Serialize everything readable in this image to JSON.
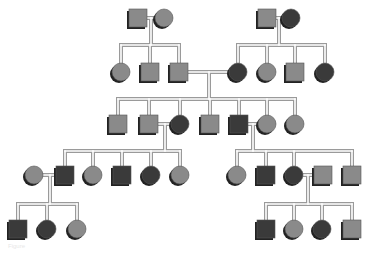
{
  "diagram": {
    "type": "pedigree",
    "colors": {
      "affected": "#3a3a3a",
      "unaffected": "#8a8a8a",
      "shadow": "#222222",
      "line_outer": "#9a9a9a",
      "line_inner": "#ffffff"
    },
    "individuals": [
      {
        "id": "I1",
        "sex": "male",
        "affected": false,
        "x": 138,
        "y": 18
      },
      {
        "id": "I2",
        "sex": "female",
        "affected": false,
        "x": 164,
        "y": 18
      },
      {
        "id": "I3",
        "sex": "male",
        "affected": false,
        "x": 267,
        "y": 18
      },
      {
        "id": "I4",
        "sex": "female",
        "affected": true,
        "x": 291,
        "y": 18
      },
      {
        "id": "II1",
        "sex": "female",
        "affected": false,
        "x": 121,
        "y": 72
      },
      {
        "id": "II2",
        "sex": "male",
        "affected": false,
        "x": 150,
        "y": 72
      },
      {
        "id": "II3",
        "sex": "male",
        "affected": false,
        "x": 179,
        "y": 72
      },
      {
        "id": "II4",
        "sex": "female",
        "affected": true,
        "x": 238,
        "y": 72
      },
      {
        "id": "II5",
        "sex": "female",
        "affected": false,
        "x": 267,
        "y": 72
      },
      {
        "id": "II6",
        "sex": "male",
        "affected": false,
        "x": 295,
        "y": 72
      },
      {
        "id": "II7",
        "sex": "female",
        "affected": true,
        "x": 325,
        "y": 72
      },
      {
        "id": "III1",
        "sex": "male",
        "affected": false,
        "x": 118,
        "y": 124
      },
      {
        "id": "III2",
        "sex": "male",
        "affected": false,
        "x": 149,
        "y": 124
      },
      {
        "id": "III3",
        "sex": "female",
        "affected": true,
        "x": 180,
        "y": 124
      },
      {
        "id": "III4",
        "sex": "male",
        "affected": false,
        "x": 210,
        "y": 124
      },
      {
        "id": "III5",
        "sex": "male",
        "affected": true,
        "x": 239,
        "y": 124
      },
      {
        "id": "III6",
        "sex": "female",
        "affected": false,
        "x": 267,
        "y": 124
      },
      {
        "id": "III7",
        "sex": "female",
        "affected": false,
        "x": 295,
        "y": 124
      },
      {
        "id": "IV1",
        "sex": "female",
        "affected": false,
        "x": 34,
        "y": 175
      },
      {
        "id": "IV2",
        "sex": "male",
        "affected": true,
        "x": 65,
        "y": 175
      },
      {
        "id": "IV3",
        "sex": "female",
        "affected": false,
        "x": 93,
        "y": 175
      },
      {
        "id": "IV4",
        "sex": "male",
        "affected": true,
        "x": 122,
        "y": 175
      },
      {
        "id": "IV5",
        "sex": "female",
        "affected": true,
        "x": 151,
        "y": 175
      },
      {
        "id": "IV6",
        "sex": "female",
        "affected": false,
        "x": 180,
        "y": 175
      },
      {
        "id": "IV7",
        "sex": "female",
        "affected": false,
        "x": 237,
        "y": 175
      },
      {
        "id": "IV8",
        "sex": "male",
        "affected": true,
        "x": 266,
        "y": 175
      },
      {
        "id": "IV9",
        "sex": "female",
        "affected": true,
        "x": 294,
        "y": 175
      },
      {
        "id": "IV10",
        "sex": "male",
        "affected": false,
        "x": 323,
        "y": 175
      },
      {
        "id": "IV11",
        "sex": "male",
        "affected": false,
        "x": 352,
        "y": 175
      },
      {
        "id": "V1",
        "sex": "male",
        "affected": true,
        "x": 18,
        "y": 229
      },
      {
        "id": "V2",
        "sex": "female",
        "affected": true,
        "x": 47,
        "y": 229
      },
      {
        "id": "V3",
        "sex": "female",
        "affected": false,
        "x": 77,
        "y": 229
      },
      {
        "id": "V4",
        "sex": "male",
        "affected": true,
        "x": 266,
        "y": 229
      },
      {
        "id": "V5",
        "sex": "female",
        "affected": false,
        "x": 294,
        "y": 229
      },
      {
        "id": "V6",
        "sex": "female",
        "affected": true,
        "x": 322,
        "y": 229
      },
      {
        "id": "V7",
        "sex": "male",
        "affected": false,
        "x": 352,
        "y": 229
      }
    ],
    "families": [
      {
        "parents": [
          "I1",
          "I2"
        ],
        "drop_x": 151,
        "sib_y": 45,
        "children": [
          "II1",
          "II2",
          "II3"
        ]
      },
      {
        "parents": [
          "I3",
          "I4"
        ],
        "drop_x": 279,
        "sib_y": 45,
        "children": [
          "II4",
          "II5",
          "II6",
          "II7"
        ]
      },
      {
        "parents": [
          "II3",
          "II4"
        ],
        "drop_x": 209,
        "sib_y": 99,
        "children": [
          "III1",
          "III2",
          "III3",
          "III4",
          "III5",
          "III6",
          "III7"
        ]
      },
      {
        "parents": [
          "III2",
          "III3"
        ],
        "drop_x": 165,
        "sib_y": 151,
        "children": [
          "IV2",
          "IV3",
          "IV4",
          "IV5",
          "IV6"
        ]
      },
      {
        "parents": [
          "III5",
          "III6"
        ],
        "drop_x": 253,
        "sib_y": 151,
        "children": [
          "IV7",
          "IV8",
          "IV9",
          "IV11"
        ]
      },
      {
        "parents": [
          "IV1",
          "IV2"
        ],
        "drop_x": 50,
        "sib_y": 204,
        "children": [
          "V1",
          "V2",
          "V3"
        ]
      },
      {
        "parents": [
          "IV9",
          "IV10"
        ],
        "drop_x": 308,
        "sib_y": 204,
        "children": [
          "V4",
          "V5",
          "V6",
          "V7"
        ]
      }
    ],
    "caption": "Figure"
  }
}
